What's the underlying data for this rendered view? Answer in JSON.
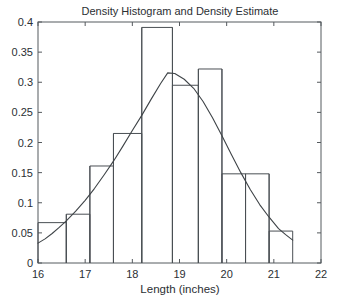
{
  "chart_data": {
    "type": "bar",
    "title": "Density Histogram and Density Estimate",
    "xlabel": "Length (inches)",
    "ylabel": "",
    "xlim": [
      16,
      22
    ],
    "ylim": [
      0,
      0.4
    ],
    "grid": false,
    "legend": null,
    "xticks": [
      "16",
      "17",
      "18",
      "19",
      "20",
      "21",
      "22"
    ],
    "xtick_values": [
      16,
      17,
      18,
      19,
      20,
      21,
      22
    ],
    "yticks": [
      "0",
      "0.05",
      "0.1",
      "0.15",
      "0.2",
      "0.25",
      "0.3",
      "0.35",
      "0.4"
    ],
    "ytick_values": [
      0,
      0.05,
      0.1,
      0.15,
      0.2,
      0.25,
      0.3,
      0.35,
      0.4
    ],
    "bin_edges": [
      16.0,
      16.6,
      17.1,
      17.6,
      18.2,
      18.85,
      19.4,
      19.9,
      20.4,
      20.9,
      21.4
    ],
    "categories": [
      "16.0-16.6",
      "16.6-17.1",
      "17.1-17.6",
      "17.6-18.2",
      "18.2-18.85",
      "18.85-19.4",
      "19.4-19.9",
      "19.9-20.4",
      "20.4-20.9",
      "20.9-21.4"
    ],
    "values": [
      0.067,
      0.081,
      0.161,
      0.215,
      0.391,
      0.295,
      0.322,
      0.148,
      0.148,
      0.053
    ],
    "series": [
      {
        "name": "Density Histogram",
        "type": "bar",
        "values": [
          0.067,
          0.081,
          0.161,
          0.215,
          0.391,
          0.295,
          0.322,
          0.148,
          0.148,
          0.053
        ]
      },
      {
        "name": "Density Estimate",
        "type": "line",
        "x": [
          16.0,
          16.15,
          16.3,
          16.45,
          16.6,
          16.8,
          17.0,
          17.2,
          17.4,
          17.6,
          17.8,
          18.0,
          18.2,
          18.4,
          18.6,
          18.75,
          18.9,
          19.1,
          19.3,
          19.5,
          19.7,
          19.9,
          20.1,
          20.3,
          20.5,
          20.7,
          20.9,
          21.1,
          21.25,
          21.4
        ],
        "y": [
          0.033,
          0.04,
          0.049,
          0.059,
          0.07,
          0.086,
          0.104,
          0.124,
          0.146,
          0.169,
          0.194,
          0.22,
          0.245,
          0.272,
          0.298,
          0.3155,
          0.3145,
          0.305,
          0.29,
          0.268,
          0.241,
          0.211,
          0.18,
          0.15,
          0.122,
          0.097,
          0.076,
          0.057,
          0.047,
          0.038
        ]
      }
    ]
  },
  "style": {
    "axis_color": "#555a5e",
    "bar_color": "#4a4f54",
    "curve_color": "#3e4347",
    "text_color": "#2b2f33",
    "background": "#ffffff"
  }
}
